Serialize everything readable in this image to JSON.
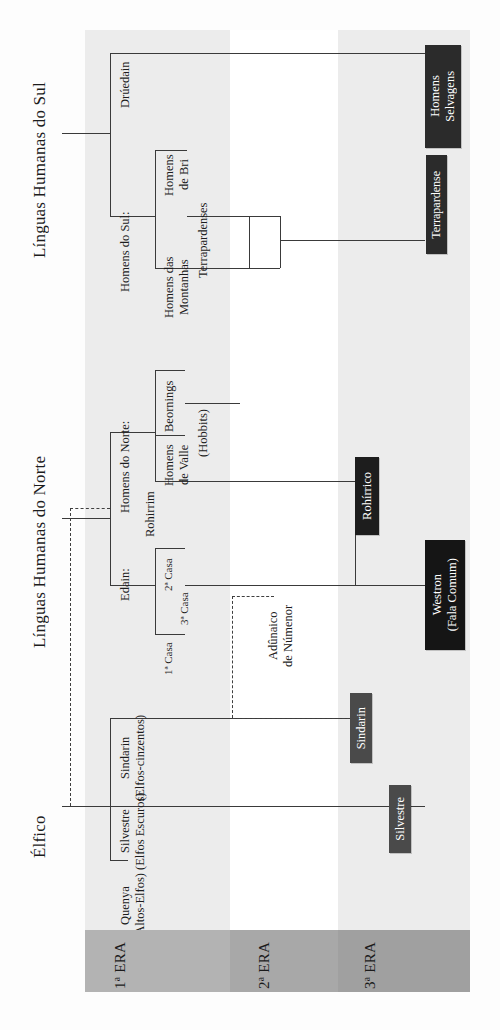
{
  "diagram": {
    "orientation": "rotated-90",
    "eras": [
      {
        "id": "era1",
        "label": "1ª ERA",
        "number": "1",
        "ordinal": "ª",
        "word": "ERA",
        "color": "#b3b3b3",
        "stripe_color": "#ececec"
      },
      {
        "id": "era2",
        "label": "2ª ERA",
        "number": "2",
        "ordinal": "ª",
        "word": "ERA",
        "color": "#a8a8a8",
        "stripe_color": "#ffffff"
      },
      {
        "id": "era3",
        "label": "3ª ERA",
        "number": "3",
        "ordinal": "ª",
        "word": "ERA",
        "color": "#a0a0a0",
        "stripe_color": "#ececec"
      }
    ],
    "headings": [
      {
        "id": "sul",
        "label": "Línguas Humanas do Sul"
      },
      {
        "id": "norte",
        "label": "Línguas Humanas do Norte"
      },
      {
        "id": "elfico",
        "label": "Élfico"
      }
    ],
    "nodes": [
      {
        "id": "druedain",
        "label": "Drúedain"
      },
      {
        "id": "homens-do-sul",
        "label": "Homens do Sul:"
      },
      {
        "id": "homens-de-bri",
        "label": "Homens\nde Bri"
      },
      {
        "id": "terrapardenses",
        "label": "Terrapardenses"
      },
      {
        "id": "homens-das-montanhas",
        "label": "Homens das\nMontanhas"
      },
      {
        "id": "homens-do-norte",
        "label": "Homens do Norte:"
      },
      {
        "id": "beornings",
        "label": "Beornings"
      },
      {
        "id": "hobbits",
        "label": "(Hobbits)"
      },
      {
        "id": "homens-de-valle",
        "label": "Homens\nde Valle"
      },
      {
        "id": "rohirrim",
        "label": "Rohirrim"
      },
      {
        "id": "edain",
        "label": "Edain:"
      },
      {
        "id": "casa2",
        "label": "2ª Casa"
      },
      {
        "id": "casa3",
        "label": "3ª Casa"
      },
      {
        "id": "casa1",
        "label": "1ª Casa"
      },
      {
        "id": "adunaico",
        "label": "Adûnaico\nde Númenor"
      },
      {
        "id": "sindarin-src",
        "label": "Sindarin\n(Elfos-cinzentos)"
      },
      {
        "id": "silvestre-src",
        "label": "Silvestre\n(Elfos Escuros)"
      },
      {
        "id": "quenya",
        "label": "Quenya\n(Altos-Elfos)"
      }
    ],
    "boxes": [
      {
        "id": "homens-selvagens",
        "label": "Homens\nSelvagens",
        "fill": "#2b2b2b",
        "text": "#ffffff"
      },
      {
        "id": "terrapardense",
        "label": "Terrapardense",
        "fill": "#2b2b2b",
        "text": "#ffffff"
      },
      {
        "id": "rohirrico",
        "label": "Rohírrico",
        "fill": "#1d1d1d",
        "text": "#ffffff"
      },
      {
        "id": "westron",
        "label": "Westron\n(Fala Comum)",
        "fill": "#151515",
        "text": "#ffffff"
      },
      {
        "id": "sindarin",
        "label": "Sindarin",
        "fill": "#4a4a4a",
        "text": "#ffffff"
      },
      {
        "id": "silvestre",
        "label": "Silvestre",
        "fill": "#4a4a4a",
        "text": "#ffffff"
      }
    ]
  }
}
